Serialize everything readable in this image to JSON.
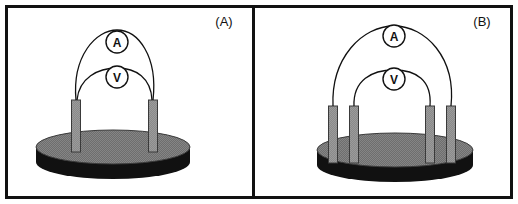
{
  "figure": {
    "background_color": "#ffffff",
    "frame_color": "#111111",
    "panels": [
      {
        "id": "panel-a",
        "label": "(A)",
        "label_x": 224,
        "label_y": 26,
        "disc": {
          "center_x": 113,
          "top_y": 147,
          "radius_x": 77,
          "radius_y": 17,
          "thickness": 15,
          "top_color": "#6e6e6e",
          "side_color": "#111111"
        },
        "electrodes": [
          {
            "name": "electrode-left",
            "x": 76,
            "top_y": 100,
            "bottom_y": 152,
            "width": 9
          },
          {
            "name": "electrode-right",
            "x": 153,
            "top_y": 100,
            "bottom_y": 152,
            "width": 9
          }
        ],
        "meters": [
          {
            "name": "ammeter",
            "letter": "A",
            "cx": 117,
            "cy": 42,
            "r": 11,
            "wire_from_x": 76,
            "wire_from_y": 100,
            "wire_to_x": 153,
            "wire_to_y": 100,
            "apex_y": 30
          },
          {
            "name": "voltmeter",
            "letter": "V",
            "cx": 117,
            "cy": 77,
            "r": 11,
            "wire_from_x": 77,
            "wire_from_y": 100,
            "wire_to_x": 152,
            "wire_to_y": 100,
            "apex_y": 68
          }
        ]
      },
      {
        "id": "panel-b",
        "label": "(B)",
        "label_x": 482,
        "label_y": 26,
        "disc": {
          "center_x": 395,
          "top_y": 150,
          "radius_x": 78,
          "radius_y": 17,
          "thickness": 15,
          "top_color": "#6e6e6e",
          "side_color": "#111111"
        },
        "electrodes": [
          {
            "name": "electrode-outer-left",
            "x": 333,
            "top_y": 106,
            "bottom_y": 163,
            "width": 9
          },
          {
            "name": "electrode-inner-left",
            "x": 354,
            "top_y": 106,
            "bottom_y": 163,
            "width": 9
          },
          {
            "name": "electrode-inner-right",
            "x": 430,
            "top_y": 106,
            "bottom_y": 163,
            "width": 9
          },
          {
            "name": "electrode-outer-right",
            "x": 451,
            "top_y": 106,
            "bottom_y": 163,
            "width": 9
          }
        ],
        "meters": [
          {
            "name": "ammeter",
            "letter": "A",
            "cx": 394,
            "cy": 36,
            "r": 11,
            "wire_from_x": 333,
            "wire_from_y": 106,
            "wire_to_x": 451,
            "wire_to_y": 106,
            "apex_y": 26
          },
          {
            "name": "voltmeter",
            "letter": "V",
            "cx": 394,
            "cy": 79,
            "r": 11,
            "wire_from_x": 354,
            "wire_from_y": 106,
            "wire_to_x": 430,
            "wire_to_y": 106,
            "apex_y": 70
          }
        ]
      }
    ],
    "colors": {
      "electrode_fill": "#8a8a8a",
      "electrode_stroke": "#3a3a3a",
      "wire_stroke": "#111111",
      "meter_fill": "#ffffff",
      "meter_stroke": "#111111"
    }
  }
}
